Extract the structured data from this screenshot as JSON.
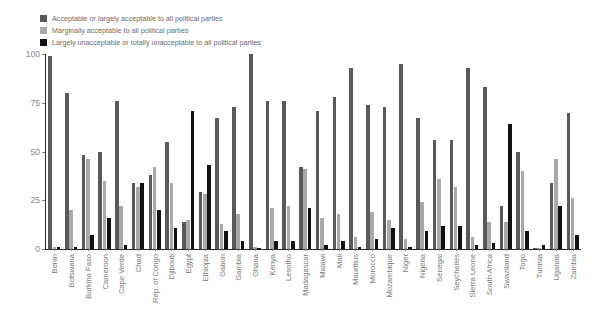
{
  "chart_data": {
    "type": "bar",
    "title": "",
    "subtitle": "",
    "xlabel": "",
    "ylabel": "",
    "ylim": [
      0,
      100
    ],
    "yticks": [
      0,
      25,
      50,
      75,
      100
    ],
    "grid": false,
    "legend_position": "top-left",
    "colors": {
      "acceptable": "#595959",
      "marginal": "#a9a9a9",
      "unacceptable": "#111111"
    },
    "legend": [
      "Acceptable or largely acceptable to all political parties",
      "Marginally acceptable to all political parties",
      "Largely unacceptable or totally unacceptable to all political parties"
    ],
    "categories": [
      "Benin",
      "Botswana",
      "Burkina Faso",
      "Cameroon",
      "Cape Verde",
      "Chad",
      "Rep. of Congo",
      "Djibouti",
      "Egypt",
      "Ethiopia",
      "Gabon",
      "Gambia",
      "Ghana",
      "Kenya",
      "Lesotho",
      "Madagascar",
      "Malawi",
      "Mali",
      "Mauritius",
      "Morocco",
      "Mozambique",
      "Niger",
      "Nigeria",
      "Senegal",
      "Seychelles",
      "Sierra Leone",
      "South Africa",
      "Swaziland",
      "Togo",
      "Tunisia",
      "Uganda",
      "Zambia"
    ],
    "series": [
      {
        "name": "Acceptable or largely acceptable to all political parties",
        "color": "#595959",
        "values": [
          99,
          80,
          48,
          50,
          76,
          34,
          38,
          55,
          14,
          29,
          67,
          73,
          100,
          76,
          76,
          42,
          71,
          78,
          93,
          74,
          73,
          95,
          67,
          56,
          56,
          93,
          83,
          22,
          50,
          0,
          34,
          70
        ]
      },
      {
        "name": "Marginally acceptable to all political parties",
        "color": "#a9a9a9",
        "values": [
          1,
          20,
          46,
          35,
          22,
          32,
          42,
          34,
          15,
          28,
          13,
          18,
          1,
          21,
          22,
          41,
          16,
          18,
          6,
          19,
          15,
          5,
          24,
          36,
          32,
          6,
          14,
          14,
          40,
          0,
          46,
          26
        ]
      },
      {
        "name": "Largely unacceptable or totally unacceptable to all political parties",
        "color": "#111111",
        "values": [
          1,
          1,
          7,
          16,
          2,
          34,
          20,
          11,
          71,
          43,
          9,
          4,
          0,
          4,
          4,
          21,
          2,
          4,
          1,
          5,
          11,
          1,
          9,
          12,
          12,
          2,
          3,
          64,
          9,
          2,
          22,
          7
        ]
      }
    ]
  }
}
